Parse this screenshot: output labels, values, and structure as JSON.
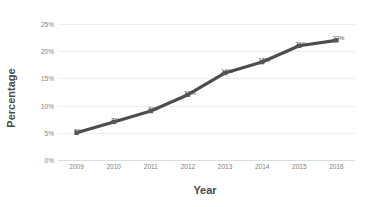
{
  "chart_data": {
    "type": "line",
    "title": "",
    "xlabel": "Year",
    "ylabel": "Percentage",
    "categories": [
      "2009",
      "2010",
      "2011",
      "2012",
      "2013",
      "2014",
      "2015",
      "2016"
    ],
    "values": [
      5,
      7,
      9,
      12,
      16,
      18,
      21,
      22
    ],
    "point_labels": [
      "5%",
      "7%",
      "9%",
      "12%",
      "16%",
      "18%",
      "21%",
      "22%"
    ],
    "ytick_labels": [
      "0%",
      "5%",
      "10%",
      "15%",
      "20%",
      "25%"
    ],
    "ytick_values": [
      0,
      5,
      10,
      15,
      20,
      25
    ],
    "ylim": [
      0,
      25
    ],
    "grid": true,
    "legend": "none",
    "series_color": "#4d4d4d",
    "marker_color": "#595959",
    "gridline_color": "#ededed",
    "axis_label_color": "#808080",
    "axis_title_color": "#4a4a4a"
  }
}
